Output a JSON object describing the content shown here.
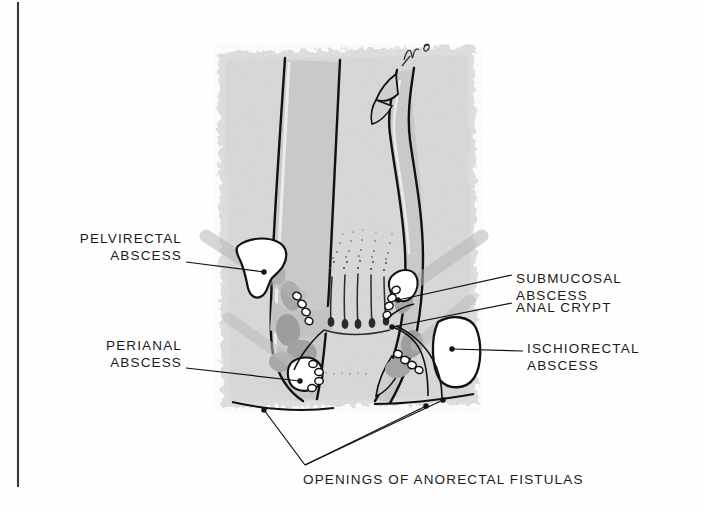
{
  "figure": {
    "kind": "medical-illustration",
    "artist_mark": "MB",
    "colors": {
      "ink": "#1b1b1b",
      "paper": "#fefefe",
      "tissue_light": "#dcdcdc",
      "tissue_mid": "#c4c4c4",
      "muscle_gray": "#a8a8a8",
      "muscle_dark": "#8f8f8f",
      "cavity_white": "#ffffff",
      "frame_line": "#3a3a3a"
    }
  },
  "labels": {
    "pelvirectal": {
      "line1": "PELVIRECTAL",
      "line2": "ABSCESS"
    },
    "perianal": {
      "line1": "PERIANAL",
      "line2": "ABSCESS"
    },
    "submucosal": {
      "line1": "SUBMUCOSAL",
      "line2": "ABSCESS"
    },
    "anal_crypt": {
      "line1": "ANAL CRYPT"
    },
    "ischiorectal": {
      "line1": "ISCHIORECTAL",
      "line2": "ABSCESS"
    },
    "openings": {
      "line1": "OPENINGS OF ANORECTAL FISTULAS"
    }
  },
  "leaders": [
    {
      "name": "pelvirectal-leader",
      "from": [
        186,
        262
      ],
      "to": [
        264,
        272
      ]
    },
    {
      "name": "perianal-leader",
      "from": [
        186,
        368
      ],
      "to": [
        300,
        381
      ]
    },
    {
      "name": "submucosal-leader",
      "from": [
        512,
        275
      ],
      "to": [
        398,
        300
      ]
    },
    {
      "name": "anal-crypt-leader",
      "from": [
        512,
        303
      ],
      "to": [
        392,
        327
      ]
    },
    {
      "name": "ischiorectal-leader",
      "from": [
        523,
        351
      ],
      "to": [
        452,
        349
      ]
    },
    {
      "name": "fistula-leader-left",
      "from": [
        305,
        465
      ],
      "to": [
        264,
        410
      ]
    },
    {
      "name": "fistula-leader-mid",
      "from": [
        305,
        465
      ],
      "to": [
        425,
        405
      ]
    },
    {
      "name": "fistula-leader-right",
      "from": [
        305,
        465
      ],
      "to": [
        442,
        400
      ]
    }
  ]
}
